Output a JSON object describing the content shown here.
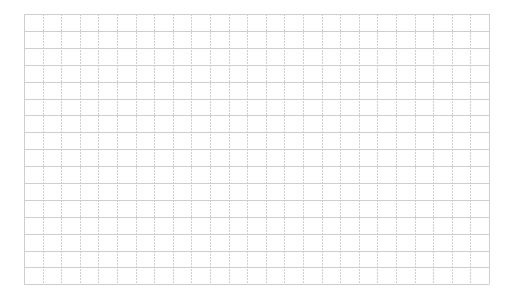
{
  "grid": {
    "columns": 25,
    "rows": 16,
    "cell_width": 18.6,
    "cell_height": 16.9,
    "line_color": "#cfcfcf",
    "background": "#ffffff",
    "cells": []
  }
}
